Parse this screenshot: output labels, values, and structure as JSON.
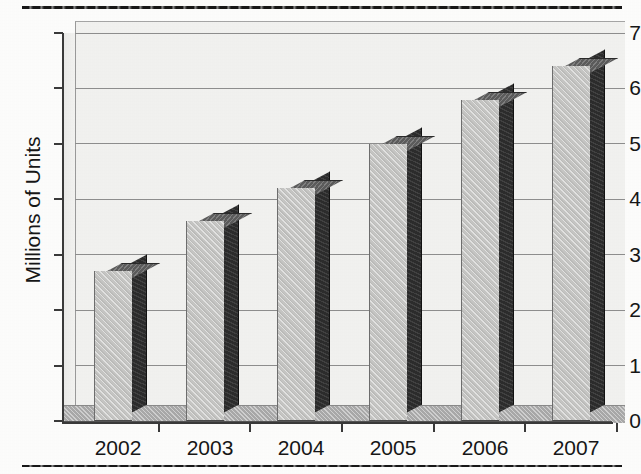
{
  "chart_data": {
    "type": "bar",
    "title": "",
    "subtitle": "",
    "xlabel": "",
    "ylabel": "Millions of Units",
    "categories": [
      "2002",
      "2003",
      "2004",
      "2005",
      "2006",
      "2007"
    ],
    "values": [
      2.7,
      3.6,
      4.2,
      5.0,
      5.8,
      6.4
    ],
    "series": [
      {
        "name": "Units",
        "values": [
          2.7,
          3.6,
          4.2,
          5.0,
          5.8,
          6.4
        ]
      }
    ],
    "ylim": [
      0,
      7
    ],
    "y_ticks": [
      0,
      1,
      2,
      3,
      4,
      5,
      6,
      7
    ],
    "y_tick_labels": [
      "0",
      "1",
      "2",
      "3",
      "4",
      "5",
      "6",
      "7"
    ],
    "grid": true,
    "grid_axis": "y",
    "legend": false,
    "legend_position": "none",
    "annotations": [],
    "style": "3d-grayscale-photocopy",
    "colors": {
      "bar_front": "#c6c6c4",
      "bar_side": "#2c2c2c",
      "bar_top": "#5c5c5c",
      "plot_background": "#f5f5f3",
      "gridline": "#8e8e8e",
      "axis": "#3a3a3a",
      "text": "#161616",
      "rule": "#171717",
      "floor": "#a9a9a9"
    }
  },
  "axes": {
    "y_title": "Millions of Units",
    "y_labels": [
      "7",
      "6",
      "5",
      "4",
      "3",
      "2",
      "1",
      "0"
    ],
    "x_labels": [
      "2002",
      "2003",
      "2004",
      "2005",
      "2006",
      "2007"
    ]
  },
  "rules": {
    "top": "",
    "bottom": ""
  }
}
